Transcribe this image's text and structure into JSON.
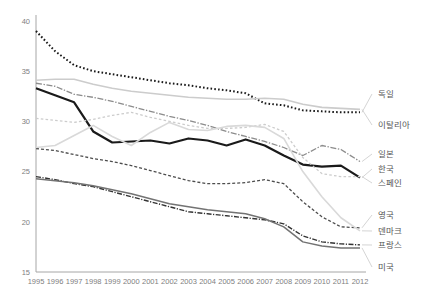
{
  "chart_data": {
    "type": "line",
    "title": "",
    "xlabel": "",
    "ylabel": "",
    "xlim": [
      1995,
      2012
    ],
    "ylim": [
      15,
      40
    ],
    "yticks": [
      15,
      20,
      25,
      30,
      35,
      40
    ],
    "xticks": [
      1995,
      1996,
      1997,
      1998,
      1999,
      2000,
      2001,
      2002,
      2003,
      2004,
      2005,
      2006,
      2007,
      2008,
      2009,
      2010,
      2011,
      2012
    ],
    "grid": false,
    "legend_position": "right-outside",
    "x": [
      1995,
      1996,
      1997,
      1998,
      1999,
      2000,
      2001,
      2002,
      2003,
      2004,
      2005,
      2006,
      2007,
      2008,
      2009,
      2010,
      2011,
      2012
    ],
    "series": [
      {
        "name": "독일",
        "style": "dotted",
        "color": "#1a1a1a",
        "width": 2.0,
        "dash": "1.6,2.2",
        "label_y": 97,
        "values": [
          39.0,
          37.0,
          35.6,
          35.0,
          34.7,
          34.4,
          34.1,
          33.8,
          33.6,
          33.3,
          33.1,
          32.8,
          31.8,
          31.6,
          31.1,
          31.0,
          30.9,
          30.9
        ]
      },
      {
        "name": "이탈리아",
        "style": "solid",
        "color": "#cccccc",
        "width": 1.6,
        "dash": "",
        "label_y": 128,
        "values": [
          34.1,
          34.2,
          34.2,
          33.7,
          33.3,
          33.0,
          32.8,
          32.6,
          32.4,
          32.3,
          32.2,
          32.2,
          32.3,
          32.2,
          31.7,
          31.4,
          31.3,
          31.2
        ]
      },
      {
        "name": "일본",
        "style": "dash-dot",
        "color": "#8c8c8c",
        "width": 1.3,
        "dash": "6,1.6,1.4,1.6",
        "label_y": 157,
        "values": [
          33.8,
          33.5,
          32.7,
          32.4,
          32.0,
          31.5,
          31.0,
          30.5,
          30.1,
          29.6,
          29.0,
          28.5,
          28.0,
          27.4,
          26.6,
          27.6,
          27.2,
          26.0
        ]
      },
      {
        "name": "한국",
        "style": "solid",
        "color": "#1a1a1a",
        "width": 2.2,
        "dash": "",
        "label_y": 172,
        "values": [
          33.3,
          32.6,
          31.9,
          29.0,
          27.9,
          28.0,
          28.1,
          27.8,
          28.3,
          28.1,
          27.6,
          28.2,
          27.6,
          26.6,
          25.7,
          25.5,
          25.6,
          24.4
        ]
      },
      {
        "name": "스페인",
        "style": "dashed",
        "color": "#cccccc",
        "width": 1.3,
        "dash": "2.6,2.2",
        "label_y": 186,
        "values": [
          30.3,
          30.1,
          29.9,
          30.2,
          30.6,
          30.9,
          30.4,
          30.0,
          29.6,
          29.3,
          29.3,
          29.4,
          29.7,
          29.0,
          26.4,
          24.8,
          24.5,
          24.5
        ]
      },
      {
        "name": "영국",
        "style": "dashed",
        "color": "#4d4d4d",
        "width": 1.3,
        "dash": "3.0,2.0",
        "label_y": 218,
        "values": [
          27.3,
          27.1,
          26.7,
          26.3,
          26.0,
          25.6,
          25.1,
          24.6,
          24.1,
          23.8,
          23.8,
          23.9,
          24.2,
          23.8,
          22.0,
          20.5,
          19.5,
          19.4
        ]
      },
      {
        "name": "덴마크",
        "style": "solid",
        "color": "#d9d9d9",
        "width": 1.6,
        "dash": "",
        "label_y": 234,
        "values": [
          27.4,
          27.6,
          28.6,
          29.6,
          28.5,
          27.6,
          28.9,
          29.9,
          29.2,
          29.1,
          29.5,
          29.6,
          29.4,
          28.3,
          25.0,
          22.5,
          20.4,
          19.1
        ]
      },
      {
        "name": "프랑스",
        "style": "dash-dot",
        "color": "#333333",
        "width": 1.4,
        "dash": "5,1.5,1.2,1.5",
        "label_y": 248,
        "values": [
          24.5,
          24.2,
          23.8,
          23.5,
          23.0,
          22.5,
          22.0,
          21.5,
          21.0,
          20.8,
          20.6,
          20.4,
          20.2,
          19.8,
          18.6,
          18.0,
          17.8,
          17.7
        ]
      },
      {
        "name": "미국",
        "style": "solid",
        "color": "#737373",
        "width": 1.5,
        "dash": "",
        "label_y": 270,
        "values": [
          24.3,
          24.1,
          23.9,
          23.6,
          23.2,
          22.8,
          22.3,
          21.8,
          21.5,
          21.2,
          21.0,
          20.8,
          20.3,
          19.5,
          18.0,
          17.6,
          17.4,
          17.4
        ]
      }
    ]
  },
  "layout": {
    "plot": {
      "left": 36,
      "right": 360,
      "top": 21,
      "bottom": 272
    },
    "legend_x": 378,
    "legend_leader_x": 372
  }
}
